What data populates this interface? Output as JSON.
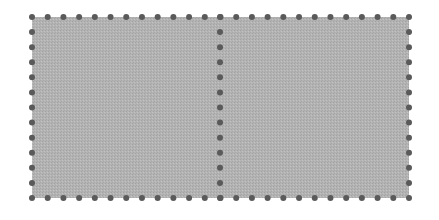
{
  "diagram": {
    "type": "perforated-sheet",
    "colors": {
      "background": "#ffffff",
      "fill": "#b3b3b3",
      "fill_dither": "#a6a6a6",
      "perforation": "#5a5a5a"
    },
    "rect": {
      "x": 32,
      "y": 17,
      "width": 377,
      "height": 181
    },
    "divider_x": 220,
    "dots": {
      "top_count": 25,
      "bottom_count": 25,
      "side_count": 13,
      "divider_count": 13,
      "radius": 3
    },
    "panels": [
      {
        "id": "left-panel"
      },
      {
        "id": "right-panel"
      }
    ]
  }
}
